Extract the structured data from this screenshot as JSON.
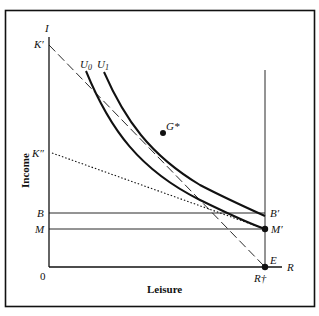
{
  "diagram": {
    "axes": {
      "y_axis_symbol": "I",
      "x_axis_symbol": "R",
      "y_title": "Income",
      "x_title": "Leisure",
      "origin_label": "0"
    },
    "y_axis_labels": {
      "k_prime": "K′",
      "k_double_prime": "K″",
      "b": "B",
      "m": "M"
    },
    "right_labels": {
      "b_prime": "B′",
      "m_prime": "M′",
      "e": "E",
      "r_dagger": "R†"
    },
    "curves": {
      "u0": {
        "base": "U",
        "sub": "0"
      },
      "u1": {
        "base": "U",
        "sub": "1"
      }
    },
    "points": {
      "g_star": "G*"
    },
    "colors": {
      "ink": "#111111",
      "background": "#ffffff"
    }
  }
}
